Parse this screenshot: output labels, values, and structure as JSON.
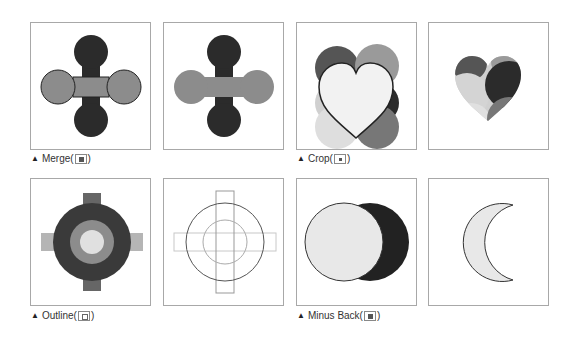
{
  "figures": [
    {
      "id": "merge",
      "caption": "Merge",
      "icon": "merge-icon"
    },
    {
      "id": "crop",
      "caption": "Crop",
      "icon": "crop-icon"
    },
    {
      "id": "outline",
      "caption": "Outline",
      "icon": "outline-icon"
    },
    {
      "id": "minus_back",
      "caption": "Minus Back",
      "icon": "minus-back-icon"
    }
  ],
  "captions": {
    "merge": "Merge(",
    "crop": "Crop(",
    "outline": "Outline(",
    "minus_back": "Minus Back(",
    "close_paren": ")",
    "marker": "▲"
  },
  "colors": {
    "dark": "#2b2b2b",
    "mid": "#8c8c8c",
    "light": "#bdbdbd",
    "pale": "#e6e6e6",
    "panel_border": "#a8a8a8"
  }
}
